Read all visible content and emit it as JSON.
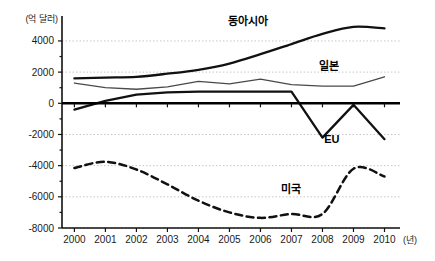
{
  "chart_data": {
    "type": "line",
    "title": "",
    "subtitle": "",
    "ylabel": "(억 달러)",
    "xlabel": "(년)",
    "x": [
      2000,
      2001,
      2002,
      2003,
      2004,
      2005,
      2006,
      2007,
      2008,
      2009,
      2010
    ],
    "categories": [
      "2000",
      "2001",
      "2002",
      "2003",
      "2004",
      "2005",
      "2006",
      "2007",
      "2008",
      "2009",
      "2010"
    ],
    "ylim": [
      -8000,
      5600
    ],
    "xlim": [
      1999.6,
      2010.5
    ],
    "yticks": [
      4000,
      2000,
      0,
      -2000,
      -4000,
      -6000,
      -8000
    ],
    "ytick_labels": [
      "4000",
      "2000",
      "0",
      "-2000",
      "-4000",
      "-6000",
      "-8000"
    ],
    "grid": true,
    "legend_position": "inline-annotations",
    "series": [
      {
        "name": "동아시아",
        "style": "solid-thick",
        "color": "#111111",
        "smooth": true,
        "label_x": 2005.6,
        "label_y": 5050,
        "values": [
          1600,
          1650,
          1700,
          1900,
          2150,
          2550,
          3150,
          3800,
          4450,
          4900,
          4800
        ]
      },
      {
        "name": "일본",
        "style": "solid-thin",
        "color": "#4a4a4a",
        "smooth": false,
        "label_x": 2008.2,
        "label_y": 2150,
        "values": [
          1300,
          1000,
          900,
          1050,
          1400,
          1250,
          1550,
          1200,
          1100,
          1100,
          1700
        ]
      },
      {
        "name": "EU",
        "style": "solid-thick",
        "color": "#111111",
        "smooth": false,
        "label_x": 2008.3,
        "label_y": -2550,
        "values": [
          -400,
          150,
          550,
          700,
          750,
          750,
          750,
          750,
          -2200,
          -100,
          -2300
        ]
      },
      {
        "name": "미국",
        "style": "dashed-thick",
        "color": "#111111",
        "smooth": true,
        "label_x": 2007.0,
        "label_y": -5750,
        "values": [
          -4150,
          -3750,
          -4250,
          -5200,
          -6250,
          -7000,
          -7350,
          -7100,
          -7100,
          -4200,
          -4700
        ]
      }
    ]
  },
  "axis": {
    "y_unit_label": "(억 달러)",
    "x_unit_label": "(년)"
  }
}
